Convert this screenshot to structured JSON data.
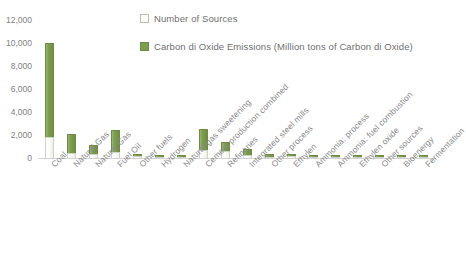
{
  "chart_data": {
    "type": "bar",
    "subtype": "stacked-column",
    "title": "",
    "xlabel": "",
    "ylabel": "",
    "ylim": [
      0,
      12000
    ],
    "ytick_step": 2000,
    "ytick_labels": [
      "12,000",
      "10,000",
      "8,000",
      "6,000",
      "4,000",
      "2,000",
      "0"
    ],
    "ytick_values": [
      12000,
      10000,
      8000,
      6000,
      4000,
      2000,
      0
    ],
    "grid": false,
    "legend_position": "top-center",
    "categories": [
      "Coal",
      "Natural Gas",
      "Natural Gas",
      "Fuel Oil",
      "Other fuels",
      "Hydrogen",
      "Natural-gas sweetening",
      "Cement production combined",
      "Refineries",
      "Integrated steel mills",
      "Other process",
      "Ethylen",
      "Ammonia: process",
      "Ammonia: fuel combustion",
      "Ethylen oxide",
      "Other sources",
      "Bioenergy",
      "Fermentation"
    ],
    "series": [
      {
        "name": "Number of Sources",
        "color": "#fbfbf9",
        "values": [
          1850,
          420,
          330,
          560,
          170,
          60,
          40,
          700,
          620,
          300,
          120,
          150,
          90,
          80,
          60,
          70,
          60,
          50
        ]
      },
      {
        "name": "Carbon di Oxide Emissions (Million tons of Carbon di Oxide)",
        "color": "#7d9e4f",
        "values": [
          8150,
          1680,
          790,
          1840,
          140,
          60,
          110,
          1800,
          780,
          520,
          230,
          210,
          160,
          150,
          110,
          120,
          110,
          100
        ]
      }
    ],
    "totals": [
      10000,
      2100,
      1120,
      2400,
      310,
      120,
      150,
      2500,
      1400,
      820,
      350,
      360,
      250,
      230,
      170,
      190,
      170,
      150
    ]
  },
  "legend": {
    "items": [
      {
        "label": "Number of Sources",
        "marker": "legend-swatch-sources"
      },
      {
        "label": "Carbon di Oxide Emissions (Million tons of Carbon di Oxide)",
        "marker": "legend-swatch-emissions"
      }
    ]
  }
}
